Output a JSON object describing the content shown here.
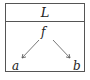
{
  "diagram": {
    "title": "L",
    "nodes": [
      {
        "id": "f",
        "label": "f"
      },
      {
        "id": "a",
        "label": "a"
      },
      {
        "id": "b",
        "label": "b"
      }
    ],
    "edges": [
      {
        "from": "f",
        "to": "a"
      },
      {
        "from": "f",
        "to": "b"
      }
    ],
    "colors": {
      "line": "#555555",
      "text": "#222222"
    }
  }
}
